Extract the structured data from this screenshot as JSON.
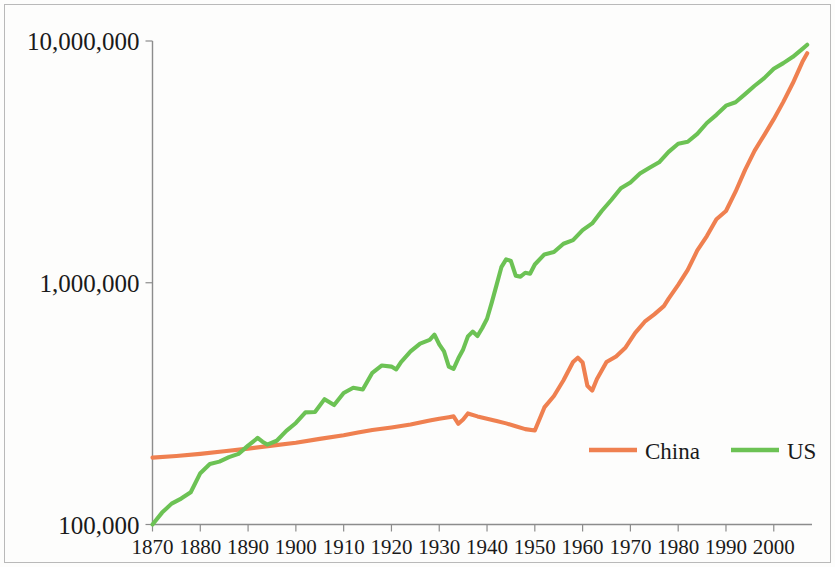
{
  "chart_data": {
    "type": "line",
    "title": "",
    "subtitle": "",
    "xlabel": "",
    "ylabel": "",
    "yscale": "log",
    "xscale": "linear",
    "grid": false,
    "xlim": [
      1870,
      2008
    ],
    "ylim": [
      100000,
      10000000
    ],
    "yticks": [
      100000,
      1000000,
      10000000
    ],
    "ytick_labels": [
      "100,000",
      "1,000,000",
      "10,000,000"
    ],
    "xticks": [
      1870,
      1880,
      1890,
      1900,
      1910,
      1920,
      1930,
      1940,
      1950,
      1960,
      1970,
      1980,
      1990,
      2000
    ],
    "xtick_labels": [
      "1870",
      "1880",
      "1890",
      "1900",
      "1910",
      "1920",
      "1930",
      "1940",
      "1950",
      "1960",
      "1970",
      "1980",
      "1990",
      "2000"
    ],
    "legend_position": "inside-bottom-right",
    "colors": {
      "china": "#ef8050",
      "us": "#6cc254",
      "axis": "#8c8c8c",
      "text": "#1a1a1a",
      "border": "#b9b9b9",
      "background": "#fdfdfc"
    },
    "series": [
      {
        "name": "China",
        "color": "#ef8050",
        "x": [
          1870,
          1875,
          1880,
          1885,
          1890,
          1895,
          1900,
          1905,
          1910,
          1913,
          1916,
          1920,
          1924,
          1928,
          1930,
          1932,
          1933,
          1934,
          1935,
          1936,
          1938,
          1940,
          1942,
          1944,
          1946,
          1948,
          1950,
          1952,
          1954,
          1956,
          1958,
          1959,
          1960,
          1961,
          1962,
          1963,
          1965,
          1967,
          1969,
          1971,
          1973,
          1975,
          1977,
          1978,
          1980,
          1982,
          1984,
          1986,
          1988,
          1990,
          1992,
          1994,
          1996,
          1998,
          2000,
          2002,
          2004,
          2006,
          2007
        ],
        "y": [
          189000,
          192000,
          196000,
          201000,
          206000,
          212000,
          218000,
          226000,
          234000,
          240000,
          246000,
          252000,
          259000,
          269000,
          274000,
          278000,
          280000,
          261000,
          272000,
          288000,
          280000,
          274000,
          268000,
          262000,
          255000,
          248000,
          245000,
          305000,
          340000,
          395000,
          470000,
          490000,
          468000,
          375000,
          358000,
          400000,
          470000,
          495000,
          540000,
          620000,
          690000,
          740000,
          800000,
          860000,
          980000,
          1130000,
          1360000,
          1560000,
          1830000,
          1980000,
          2380000,
          2930000,
          3520000,
          4080000,
          4750000,
          5600000,
          6700000,
          8200000,
          8900000
        ]
      },
      {
        "name": "US",
        "color": "#6cc254",
        "x": [
          1870,
          1872,
          1874,
          1876,
          1878,
          1880,
          1882,
          1884,
          1886,
          1888,
          1890,
          1892,
          1893,
          1894,
          1896,
          1898,
          1900,
          1902,
          1904,
          1906,
          1908,
          1910,
          1912,
          1914,
          1916,
          1918,
          1920,
          1921,
          1922,
          1924,
          1926,
          1928,
          1929,
          1930,
          1931,
          1932,
          1933,
          1934,
          1935,
          1936,
          1937,
          1938,
          1939,
          1940,
          1941,
          1942,
          1943,
          1944,
          1945,
          1946,
          1947,
          1948,
          1949,
          1950,
          1952,
          1954,
          1956,
          1958,
          1960,
          1962,
          1964,
          1966,
          1968,
          1970,
          1972,
          1974,
          1976,
          1978,
          1980,
          1982,
          1984,
          1986,
          1988,
          1990,
          1992,
          1994,
          1996,
          1998,
          2000,
          2002,
          2004,
          2006,
          2007
        ],
        "y": [
          100000,
          112000,
          122000,
          128000,
          136000,
          163000,
          178000,
          182000,
          190000,
          196000,
          212000,
          228000,
          220000,
          214000,
          222000,
          244000,
          263000,
          291000,
          292000,
          330000,
          312000,
          350000,
          368000,
          362000,
          424000,
          455000,
          450000,
          438000,
          470000,
          520000,
          560000,
          580000,
          610000,
          556000,
          520000,
          450000,
          440000,
          487000,
          530000,
          600000,
          628000,
          602000,
          650000,
          710000,
          830000,
          980000,
          1160000,
          1250000,
          1230000,
          1070000,
          1060000,
          1100000,
          1090000,
          1190000,
          1310000,
          1340000,
          1450000,
          1500000,
          1650000,
          1760000,
          1980000,
          2200000,
          2460000,
          2600000,
          2830000,
          2990000,
          3150000,
          3480000,
          3760000,
          3830000,
          4130000,
          4580000,
          4950000,
          5400000,
          5580000,
          6030000,
          6530000,
          7020000,
          7680000,
          8100000,
          8600000,
          9280000,
          9650000
        ]
      }
    ]
  },
  "legend": {
    "items": [
      {
        "label": "China",
        "color": "#ef8050"
      },
      {
        "label": "US",
        "color": "#6cc254"
      }
    ]
  }
}
